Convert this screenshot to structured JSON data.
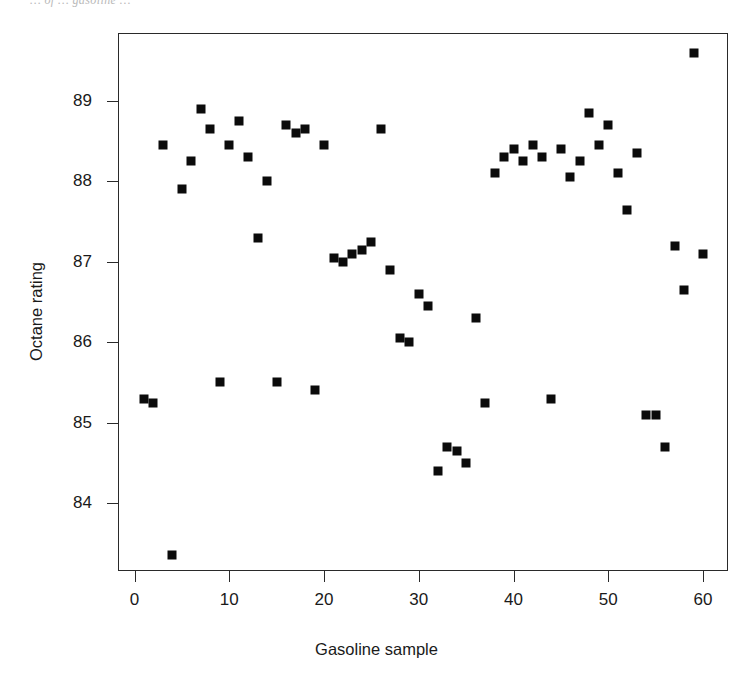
{
  "page": {
    "running_head": "… of   … gasoline …"
  },
  "chart_data": {
    "type": "scatter",
    "title": "",
    "xlabel": "Gasoline sample",
    "ylabel": "Octane rating",
    "xlim": [
      -0.5,
      62.5
    ],
    "ylim": [
      83.0,
      89.95
    ],
    "grid": false,
    "legend": null,
    "marker": "filled-square",
    "marker_color": "#0b0b0b",
    "xticks": [
      0,
      10,
      20,
      30,
      40,
      50,
      60
    ],
    "xticklabels": [
      "0",
      "10",
      "20",
      "30",
      "40",
      "50",
      "60"
    ],
    "yticks": [
      84,
      85,
      86,
      87,
      88,
      89
    ],
    "yticklabels": [
      "84",
      "85",
      "86",
      "87",
      "88",
      "89"
    ],
    "x": [
      1,
      2,
      3,
      4,
      5,
      6,
      7,
      8,
      9,
      10,
      11,
      12,
      13,
      14,
      15,
      16,
      17,
      18,
      19,
      20,
      21,
      22,
      23,
      24,
      25,
      26,
      27,
      28,
      29,
      30,
      31,
      32,
      33,
      34,
      35,
      36,
      37,
      38,
      39,
      40,
      41,
      42,
      43,
      44,
      45,
      46,
      47,
      48,
      49,
      50,
      51,
      52,
      53,
      54,
      55,
      56,
      57,
      58,
      59,
      60
    ],
    "y": [
      85.3,
      85.25,
      88.45,
      83.35,
      87.9,
      88.25,
      88.9,
      88.65,
      85.5,
      88.45,
      88.75,
      88.3,
      87.3,
      88.0,
      85.5,
      88.7,
      88.6,
      88.65,
      85.4,
      88.45,
      87.05,
      87.0,
      87.1,
      87.15,
      87.25,
      88.65,
      86.9,
      86.05,
      86.0,
      86.6,
      86.45,
      84.4,
      84.7,
      84.65,
      84.5,
      86.3,
      85.25,
      88.1,
      88.3,
      88.4,
      88.25,
      88.45,
      88.3,
      85.3,
      88.4,
      88.05,
      88.25,
      88.85,
      88.45,
      88.7,
      88.1,
      87.65,
      88.35,
      85.1,
      85.1,
      84.7,
      87.2,
      86.65,
      89.6,
      87.1
    ]
  }
}
